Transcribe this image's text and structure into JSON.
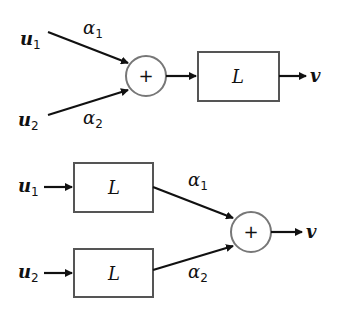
{
  "diagram": {
    "top": {
      "inputs": [
        {
          "name": "u",
          "sub": "1",
          "gain": "α",
          "gain_sub": "1"
        },
        {
          "name": "u",
          "sub": "2",
          "gain": "α",
          "gain_sub": "2"
        }
      ],
      "summer": "+",
      "block": "L",
      "output": "v"
    },
    "bottom": {
      "inputs": [
        {
          "name": "u",
          "sub": "1",
          "block": "L",
          "gain": "α",
          "gain_sub": "1"
        },
        {
          "name": "u",
          "sub": "2",
          "block": "L",
          "gain": "α",
          "gain_sub": "2"
        }
      ],
      "summer": "+",
      "output": "v"
    }
  },
  "colors": {
    "line": "#111111",
    "box_border": "#555555",
    "circle_border": "#777777"
  }
}
